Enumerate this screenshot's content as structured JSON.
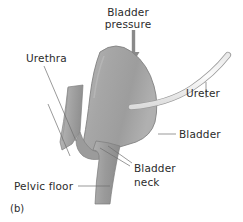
{
  "figure": {
    "panel_label": "(b)",
    "background_color": "#ffffff",
    "text_color": "#2b2b2b"
  },
  "labels": {
    "bladder_pressure_line1": "Bladder",
    "bladder_pressure_line2": "pressure",
    "urethra": "Urethra",
    "ureter": "Ureter",
    "bladder": "Bladder",
    "bladder_neck_line1": "Bladder",
    "bladder_neck_line2": "neck",
    "pelvic_floor": "Pelvic floor"
  },
  "colors": {
    "organ_gray": "#a9a9a9",
    "organ_gray_dark": "#8e8e8e",
    "organ_gray_light": "#c2c2c2",
    "outline": "#7a7a7a",
    "arrow": "#8a8a8a",
    "leader_line": "#6f6f6f",
    "ureter_fill": "#f2f2f2"
  },
  "icons": {
    "pressure_arrow": "down-arrow-icon"
  }
}
